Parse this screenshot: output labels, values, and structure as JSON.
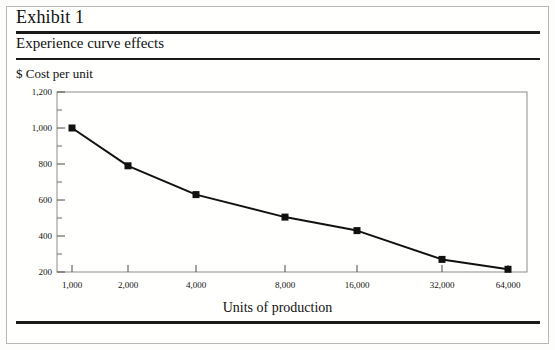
{
  "header": {
    "exhibit_title": "Exhibit 1",
    "subtitle": "Experience curve effects"
  },
  "chart_data": {
    "type": "line",
    "title": "Experience curve effects",
    "xlabel": "Units of production",
    "ylabel": "$ Cost per unit",
    "x_scale": "log2",
    "categories": [
      "1,000",
      "2,000",
      "4,000",
      "8,000",
      "16,000",
      "32,000",
      "64,000"
    ],
    "x": [
      1000,
      2000,
      4000,
      8000,
      16000,
      32000,
      64000
    ],
    "values": [
      1000,
      790,
      630,
      505,
      430,
      270,
      215
    ],
    "ylim": [
      200,
      1200
    ],
    "y_ticks": [
      200,
      400,
      600,
      800,
      1000,
      1200
    ],
    "y_tick_labels": [
      "200",
      "400",
      "600",
      "800",
      "1,000",
      "1,200"
    ],
    "y_minor_ticks": [
      300,
      500,
      700,
      900,
      1100
    ],
    "grid": false,
    "legend": "none",
    "marker": "square",
    "marker_color": "#111111",
    "line_color": "#111111"
  }
}
